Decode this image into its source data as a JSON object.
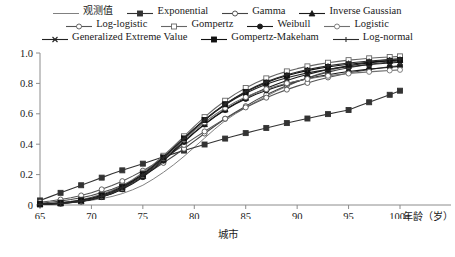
{
  "chart_data": {
    "type": "line",
    "title": "",
    "subtitle": "",
    "xlabel": "城市",
    "xlabel_right": "年龄（岁）",
    "ylabel": "",
    "xlim": [
      65,
      100
    ],
    "ylim": [
      0,
      1.0
    ],
    "grid": false,
    "legend_position": "top",
    "x_tick_labels": [
      "65",
      "70",
      "75",
      "80",
      "85",
      "90",
      "95",
      "100+"
    ],
    "x_ticks": [
      65,
      70,
      75,
      80,
      85,
      90,
      95,
      100
    ],
    "y_tick_labels": [
      "0",
      "0.2",
      "0.4",
      "0.6",
      "0.8",
      "1.0"
    ],
    "y_ticks": [
      0,
      0.2,
      0.4,
      0.6,
      0.8,
      1.0
    ],
    "x": [
      65,
      66,
      67,
      68,
      69,
      70,
      71,
      72,
      73,
      74,
      75,
      76,
      77,
      78,
      79,
      80,
      81,
      82,
      83,
      84,
      85,
      86,
      87,
      88,
      89,
      90,
      91,
      92,
      93,
      94,
      95,
      96,
      97,
      98,
      99,
      100
    ],
    "series": [
      {
        "name": "观测值",
        "marker": "none",
        "fill": "none",
        "color": "#808080",
        "values": [
          0.005,
          0.008,
          0.012,
          0.017,
          0.023,
          0.031,
          0.042,
          0.056,
          0.075,
          0.1,
          0.13,
          0.17,
          0.215,
          0.265,
          0.32,
          0.38,
          0.44,
          0.5,
          0.555,
          0.6,
          0.64,
          0.68,
          0.715,
          0.75,
          0.78,
          0.81,
          0.835,
          0.86,
          0.88,
          0.9,
          0.915,
          0.93,
          0.94,
          0.95,
          0.958,
          0.965
        ]
      },
      {
        "name": "Exponential",
        "marker": "square",
        "fill": "filled",
        "color": "#333333",
        "values": [
          0.03,
          0.055,
          0.08,
          0.105,
          0.13,
          0.155,
          0.18,
          0.205,
          0.228,
          0.25,
          0.272,
          0.295,
          0.317,
          0.338,
          0.358,
          0.378,
          0.398,
          0.418,
          0.437,
          0.455,
          0.473,
          0.49,
          0.507,
          0.523,
          0.539,
          0.554,
          0.569,
          0.584,
          0.598,
          0.612,
          0.625,
          0.651,
          0.676,
          0.7,
          0.725,
          0.752
        ]
      },
      {
        "name": "Gamma",
        "marker": "circle",
        "fill": "open",
        "color": "#444444",
        "values": [
          0.012,
          0.018,
          0.026,
          0.036,
          0.048,
          0.063,
          0.082,
          0.104,
          0.13,
          0.16,
          0.195,
          0.234,
          0.277,
          0.322,
          0.37,
          0.42,
          0.47,
          0.52,
          0.567,
          0.61,
          0.65,
          0.69,
          0.725,
          0.757,
          0.786,
          0.812,
          0.835,
          0.856,
          0.874,
          0.89,
          0.903,
          0.915,
          0.925,
          0.934,
          0.941,
          0.948
        ]
      },
      {
        "name": "Inverse Gaussian",
        "marker": "triangle",
        "fill": "filled",
        "color": "#1a1a1a",
        "values": [
          0.004,
          0.006,
          0.01,
          0.016,
          0.024,
          0.036,
          0.053,
          0.076,
          0.106,
          0.144,
          0.19,
          0.243,
          0.3,
          0.36,
          0.42,
          0.478,
          0.532,
          0.582,
          0.628,
          0.668,
          0.705,
          0.738,
          0.768,
          0.795,
          0.819,
          0.84,
          0.859,
          0.876,
          0.891,
          0.904,
          0.916,
          0.926,
          0.935,
          0.943,
          0.95,
          0.956
        ]
      },
      {
        "name": "Log-logistic",
        "marker": "circle",
        "fill": "open",
        "color": "#555555",
        "values": [
          0.018,
          0.026,
          0.036,
          0.048,
          0.063,
          0.081,
          0.103,
          0.128,
          0.157,
          0.19,
          0.226,
          0.265,
          0.307,
          0.35,
          0.395,
          0.44,
          0.484,
          0.527,
          0.568,
          0.606,
          0.642,
          0.675,
          0.706,
          0.734,
          0.759,
          0.782,
          0.803,
          0.822,
          0.839,
          0.854,
          0.868,
          0.88,
          0.891,
          0.901,
          0.91,
          0.918
        ]
      },
      {
        "name": "Gompertz",
        "marker": "square",
        "fill": "open",
        "color": "#666666",
        "values": [
          0.006,
          0.01,
          0.016,
          0.024,
          0.035,
          0.05,
          0.07,
          0.095,
          0.127,
          0.166,
          0.212,
          0.265,
          0.324,
          0.387,
          0.452,
          0.517,
          0.578,
          0.635,
          0.686,
          0.731,
          0.77,
          0.804,
          0.833,
          0.858,
          0.879,
          0.897,
          0.912,
          0.925,
          0.936,
          0.945,
          0.953,
          0.959,
          0.965,
          0.97,
          0.974,
          0.978
        ]
      },
      {
        "name": "Weibull",
        "marker": "circle",
        "fill": "filled",
        "color": "#1a1a1a",
        "values": [
          0.003,
          0.005,
          0.009,
          0.015,
          0.023,
          0.035,
          0.052,
          0.074,
          0.103,
          0.139,
          0.183,
          0.234,
          0.291,
          0.352,
          0.414,
          0.474,
          0.53,
          0.58,
          0.625,
          0.664,
          0.698,
          0.728,
          0.754,
          0.777,
          0.797,
          0.815,
          0.831,
          0.845,
          0.857,
          0.868,
          0.878,
          0.886,
          0.894,
          0.9,
          0.906,
          0.912
        ]
      },
      {
        "name": "Logistic",
        "marker": "circle",
        "fill": "open",
        "color": "#707070",
        "values": [
          0.004,
          0.007,
          0.011,
          0.017,
          0.026,
          0.039,
          0.057,
          0.081,
          0.112,
          0.151,
          0.197,
          0.25,
          0.308,
          0.369,
          0.43,
          0.489,
          0.544,
          0.594,
          0.638,
          0.677,
          0.71,
          0.738,
          0.762,
          0.783,
          0.801,
          0.816,
          0.829,
          0.84,
          0.85,
          0.858,
          0.865,
          0.871,
          0.876,
          0.881,
          0.885,
          0.889
        ]
      },
      {
        "name": "Generalized Extreme Value",
        "marker": "x",
        "fill": "filled",
        "color": "#222222",
        "values": [
          0.004,
          0.007,
          0.011,
          0.017,
          0.026,
          0.039,
          0.057,
          0.081,
          0.113,
          0.152,
          0.199,
          0.253,
          0.313,
          0.376,
          0.44,
          0.502,
          0.559,
          0.612,
          0.659,
          0.7,
          0.736,
          0.767,
          0.794,
          0.817,
          0.837,
          0.854,
          0.869,
          0.881,
          0.892,
          0.902,
          0.91,
          0.917,
          0.924,
          0.929,
          0.934,
          0.939
        ]
      },
      {
        "name": "Gompertz-Makeham",
        "marker": "square",
        "fill": "filled",
        "color": "#111111",
        "values": [
          0.006,
          0.009,
          0.014,
          0.021,
          0.031,
          0.045,
          0.064,
          0.089,
          0.12,
          0.158,
          0.203,
          0.255,
          0.313,
          0.375,
          0.438,
          0.5,
          0.559,
          0.614,
          0.663,
          0.706,
          0.744,
          0.777,
          0.805,
          0.83,
          0.851,
          0.869,
          0.884,
          0.897,
          0.908,
          0.918,
          0.926,
          0.933,
          0.939,
          0.945,
          0.949,
          0.954
        ]
      },
      {
        "name": "Log-normal",
        "marker": "plus",
        "fill": "filled",
        "color": "#2a2a2a",
        "values": [
          0.004,
          0.007,
          0.011,
          0.018,
          0.027,
          0.04,
          0.058,
          0.082,
          0.113,
          0.152,
          0.198,
          0.252,
          0.311,
          0.374,
          0.438,
          0.5,
          0.559,
          0.614,
          0.664,
          0.708,
          0.747,
          0.781,
          0.81,
          0.835,
          0.857,
          0.875,
          0.891,
          0.904,
          0.916,
          0.925,
          0.934,
          0.941,
          0.947,
          0.952,
          0.957,
          0.961
        ]
      }
    ]
  },
  "legend": {
    "rows": [
      [
        {
          "label": "观测值",
          "series": 0,
          "cjk": true
        },
        {
          "label": "Exponential",
          "series": 1,
          "cjk": false
        },
        {
          "label": "Gamma",
          "series": 2,
          "cjk": false
        },
        {
          "label": "Inverse Gaussian",
          "series": 3,
          "cjk": false
        }
      ],
      [
        {
          "label": "Log-logistic",
          "series": 4,
          "cjk": false
        },
        {
          "label": "Gompertz",
          "series": 5,
          "cjk": false
        },
        {
          "label": "Weibull",
          "series": 6,
          "cjk": false
        },
        {
          "label": "Logistic",
          "series": 7,
          "cjk": false
        }
      ],
      [
        {
          "label": "Generalized Extreme Value",
          "series": 8,
          "cjk": false
        },
        {
          "label": "Gompertz-Makeham",
          "series": 9,
          "cjk": false
        },
        {
          "label": "Log-normal",
          "series": 10,
          "cjk": false
        }
      ]
    ]
  }
}
